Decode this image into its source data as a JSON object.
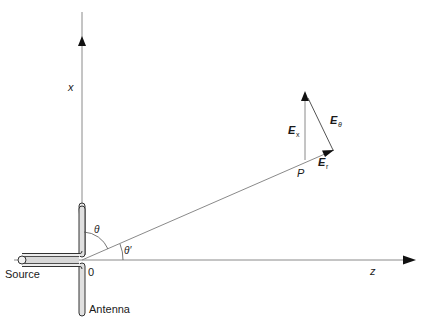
{
  "diagram": {
    "axes": {
      "x_label": "x",
      "z_label": "z",
      "origin_label": "0"
    },
    "angles": {
      "theta": "θ",
      "theta_prime": "θ′"
    },
    "point": {
      "label": "P"
    },
    "vectors": {
      "Ex": {
        "main": "E",
        "sub": "x"
      },
      "Er": {
        "main": "E",
        "sub": "r"
      },
      "Etheta": {
        "main": "E",
        "sub": "θ"
      }
    },
    "components": {
      "source_label": "Source",
      "antenna_label": "Antenna"
    },
    "colors": {
      "line": "#7a7a7a",
      "arrow": "#111111",
      "antenna_fill": "#d8d8d8",
      "antenna_stroke": "#333333"
    }
  }
}
